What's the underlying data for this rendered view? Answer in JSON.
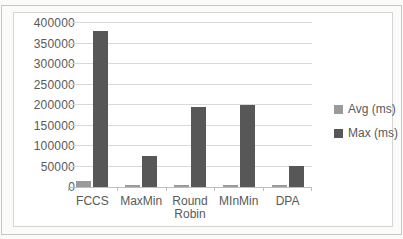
{
  "style": {
    "background": "#fbfbf9",
    "chart_background": "#ffffff",
    "text_color": "#595959",
    "gridline_color": "#d9d9d9",
    "axis_color": "#bfbfbf",
    "frame_color": "#d5d5d5",
    "scan_border_color": "#c7c7c5"
  },
  "chart_data": {
    "type": "bar",
    "title": "",
    "xlabel": "",
    "ylabel": "",
    "categories": [
      "FCCS",
      "MaxMin",
      "Round Robin",
      "MInMin",
      "DPA"
    ],
    "series": [
      {
        "name": "Avg (ms)",
        "color": "#9a9a9a",
        "values": [
          15000,
          5000,
          5000,
          5000,
          5000
        ]
      },
      {
        "name": "Max (ms)",
        "color": "#575757",
        "values": [
          380000,
          75000,
          195000,
          200000,
          52000
        ]
      }
    ],
    "ylim": [
      0,
      400000
    ],
    "yticks": [
      "0",
      "50000",
      "100000",
      "150000",
      "200000",
      "250000",
      "300000",
      "350000",
      "400000"
    ],
    "grid": true,
    "legend_position": "right"
  }
}
